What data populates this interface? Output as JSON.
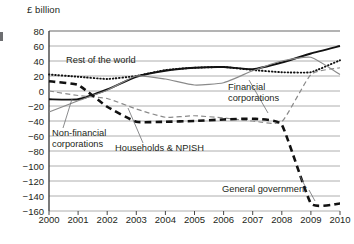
{
  "chart": {
    "axis_unit_label": "£ billion",
    "type": "line"
  },
  "chart_data": {
    "type": "line",
    "title": "",
    "subtitle": "",
    "xlabel": "",
    "ylabel": "£ billion",
    "ylim": [
      -160,
      80
    ],
    "xlim": [
      2000,
      2010
    ],
    "grid": true,
    "legend": "inline-annotations",
    "x": [
      2000,
      2001,
      2002,
      2003,
      2004,
      2005,
      2006,
      2007,
      2008,
      2009,
      2010
    ],
    "xticklabels": [
      "2000",
      "2001",
      "2002",
      "2003",
      "2004",
      "2005",
      "2006",
      "2007",
      "2008",
      "2009",
      "2010"
    ],
    "yticks": [
      80,
      60,
      40,
      20,
      0,
      -20,
      -40,
      -60,
      -80,
      -100,
      -120,
      -140,
      -160
    ],
    "yticklabels": [
      "80",
      "60",
      "40",
      "20",
      "0",
      "−20",
      "−40",
      "−60",
      "−80",
      "−100",
      "−120",
      "−140",
      "−160"
    ],
    "series": [
      {
        "name": "Rest of the world",
        "style": "dotted",
        "color": "#111111",
        "values": [
          22,
          19,
          16,
          20,
          28,
          31,
          32,
          28,
          25,
          25,
          41
        ]
      },
      {
        "name": "Financial corporations",
        "style": "solid",
        "color": "#111111",
        "values": [
          -11,
          -11,
          2,
          19,
          27,
          31,
          32,
          29,
          38,
          50,
          60
        ]
      },
      {
        "name": "Non-financial corporations",
        "style": "solid-grey",
        "color": "#8a8a8a",
        "values": [
          -28,
          -13,
          1,
          20,
          16,
          8,
          11,
          27,
          40,
          45,
          22
        ]
      },
      {
        "name": "Households & NPISH",
        "style": "dashed-grey",
        "color": "#8a8a8a",
        "values": [
          0,
          -6,
          -10,
          -24,
          -35,
          -33,
          -36,
          -40,
          -41,
          22,
          31
        ]
      },
      {
        "name": "General government",
        "style": "dashed-bold",
        "color": "#111111",
        "values": [
          13,
          8,
          -21,
          -41,
          -41,
          -40,
          -38,
          -37,
          -45,
          -150,
          -150
        ]
      }
    ],
    "annotations": [
      {
        "text": "Rest of the world",
        "x": 2000.6,
        "y": 44
      },
      {
        "text": "Financial corporations",
        "x": 2006.2,
        "y": 3
      },
      {
        "text": "Non-financial corporations",
        "x": 2000.1,
        "y": -62
      },
      {
        "text": "Households & NPISH",
        "x": 2002.3,
        "y": -78
      },
      {
        "text": "General government",
        "x": 2006.1,
        "y": -133
      }
    ]
  },
  "labels": {
    "rest_of_world": "Rest of the world",
    "financial_line1": "Financial",
    "financial_line2": "corporations",
    "nonfinancial_line1": "Non-financial",
    "nonfinancial_line2": "corporations",
    "households": "Households & NPISH",
    "general_government": "General government"
  }
}
